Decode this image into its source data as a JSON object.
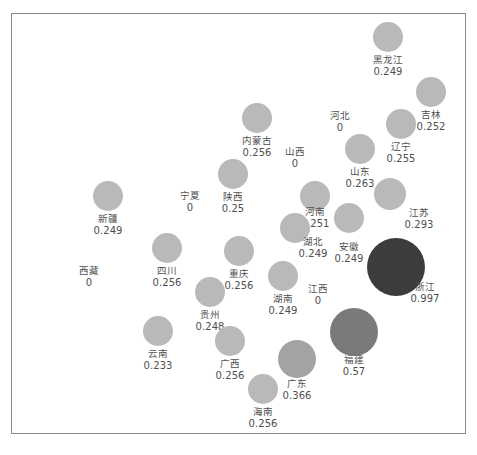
{
  "chart_data": {
    "type": "scatter",
    "title": "",
    "subtitle": "",
    "xlabel": "",
    "ylabel": "",
    "grid": false,
    "legend": "none",
    "axis_visible": false,
    "frame": true,
    "value_range": [
      0,
      0.997
    ],
    "colors": {
      "background": "#ffffff",
      "frame_border": "#8a8a8a",
      "bubble_low": "#b9b9b9",
      "bubble_mid": "#7a7a7a",
      "bubble_high": "#3c3c3c",
      "label_text": "#4f4f4f"
    },
    "note": "Bubble map of Chinese provinces; bubble area and darkness encode the value. Provinces with value 0 are shown as text labels only.",
    "points": [
      {
        "name": "黑龙江",
        "value": "0.249",
        "v": 0.249,
        "cx": 388,
        "cy": 37,
        "r": 15,
        "color": "#b9b9b9",
        "label_x": 388,
        "label_y": 54
      },
      {
        "name": "吉林",
        "value": "0.252",
        "v": 0.252,
        "cx": 431,
        "cy": 92,
        "r": 15,
        "color": "#b9b9b9",
        "label_x": 431,
        "label_y": 109
      },
      {
        "name": "河北",
        "value": "0",
        "v": 0,
        "cx": 340,
        "cy": 104,
        "r": 0,
        "color": "#b9b9b9",
        "label_x": 340,
        "label_y": 110
      },
      {
        "name": "辽宁",
        "value": "0.255",
        "v": 0.255,
        "cx": 401,
        "cy": 124,
        "r": 15,
        "color": "#b9b9b9",
        "label_x": 401,
        "label_y": 141
      },
      {
        "name": "内蒙古",
        "value": "0.256",
        "v": 0.256,
        "cx": 257,
        "cy": 118,
        "r": 15,
        "color": "#b9b9b9",
        "label_x": 257,
        "label_y": 135
      },
      {
        "name": "山西",
        "value": "0",
        "v": 0,
        "cx": 295,
        "cy": 140,
        "r": 0,
        "color": "#b9b9b9",
        "label_x": 295,
        "label_y": 146
      },
      {
        "name": "山东",
        "value": "0.263",
        "v": 0.263,
        "cx": 360,
        "cy": 149,
        "r": 15,
        "color": "#b9b9b9",
        "label_x": 360,
        "label_y": 166
      },
      {
        "name": "陕西",
        "value": "0.25",
        "v": 0.25,
        "cx": 233,
        "cy": 174,
        "r": 15,
        "color": "#b9b9b9",
        "label_x": 233,
        "label_y": 191
      },
      {
        "name": "宁夏",
        "value": "0",
        "v": 0,
        "cx": 190,
        "cy": 184,
        "r": 0,
        "color": "#b9b9b9",
        "label_x": 190,
        "label_y": 190
      },
      {
        "name": "新疆",
        "value": "0.249",
        "v": 0.249,
        "cx": 108,
        "cy": 196,
        "r": 15,
        "color": "#b9b9b9",
        "label_x": 108,
        "label_y": 213
      },
      {
        "name": "江苏",
        "value": "0.293",
        "v": 0.293,
        "cx": 390,
        "cy": 194,
        "r": 16,
        "color": "#b9b9b9",
        "label_x": 419,
        "label_y": 207
      },
      {
        "name": "河南",
        "value": "0.251",
        "v": 0.251,
        "cx": 315,
        "cy": 196,
        "r": 15,
        "color": "#b9b9b9",
        "label_x": 315,
        "label_y": 206
      },
      {
        "name": "安徽",
        "value": "0.249",
        "v": 0.249,
        "cx": 349,
        "cy": 218,
        "r": 15,
        "color": "#b9b9b9",
        "label_x": 349,
        "label_y": 241
      },
      {
        "name": "湖北",
        "value": "0.249",
        "v": 0.249,
        "cx": 295,
        "cy": 228,
        "r": 15,
        "color": "#b9b9b9",
        "label_x": 313,
        "label_y": 236
      },
      {
        "name": "西藏",
        "value": "0",
        "v": 0,
        "cx": 89,
        "cy": 265,
        "r": 0,
        "color": "#b9b9b9",
        "label_x": 89,
        "label_y": 265
      },
      {
        "name": "四川",
        "value": "0.256",
        "v": 0.256,
        "cx": 167,
        "cy": 248,
        "r": 15,
        "color": "#b9b9b9",
        "label_x": 167,
        "label_y": 265
      },
      {
        "name": "重庆",
        "value": "0.256",
        "v": 0.256,
        "cx": 239,
        "cy": 251,
        "r": 15,
        "color": "#b9b9b9",
        "label_x": 239,
        "label_y": 268
      },
      {
        "name": "浙江",
        "value": "0.997",
        "v": 0.997,
        "cx": 396,
        "cy": 267,
        "r": 29,
        "color": "#3c3c3c",
        "label_x": 425,
        "label_y": 281
      },
      {
        "name": "江西",
        "value": "0",
        "v": 0,
        "cx": 318,
        "cy": 283,
        "r": 0,
        "color": "#b9b9b9",
        "label_x": 318,
        "label_y": 283
      },
      {
        "name": "湖南",
        "value": "0.249",
        "v": 0.249,
        "cx": 283,
        "cy": 276,
        "r": 15,
        "color": "#b9b9b9",
        "label_x": 283,
        "label_y": 293
      },
      {
        "name": "贵州",
        "value": "0.248",
        "v": 0.248,
        "cx": 210,
        "cy": 292,
        "r": 15,
        "color": "#b9b9b9",
        "label_x": 210,
        "label_y": 309
      },
      {
        "name": "福建",
        "value": "0.57",
        "v": 0.57,
        "cx": 354,
        "cy": 332,
        "r": 24,
        "color": "#7a7a7a",
        "label_x": 354,
        "label_y": 354
      },
      {
        "name": "云南",
        "value": "0.233",
        "v": 0.233,
        "cx": 158,
        "cy": 331,
        "r": 15,
        "color": "#b9b9b9",
        "label_x": 158,
        "label_y": 348
      },
      {
        "name": "广西",
        "value": "0.256",
        "v": 0.256,
        "cx": 230,
        "cy": 341,
        "r": 15,
        "color": "#b9b9b9",
        "label_x": 230,
        "label_y": 358
      },
      {
        "name": "广东",
        "value": "0.366",
        "v": 0.366,
        "cx": 297,
        "cy": 359,
        "r": 19,
        "color": "#a3a3a3",
        "label_x": 297,
        "label_y": 378
      },
      {
        "name": "海南",
        "value": "0.256",
        "v": 0.256,
        "cx": 263,
        "cy": 389,
        "r": 15,
        "color": "#b9b9b9",
        "label_x": 263,
        "label_y": 406
      }
    ]
  }
}
